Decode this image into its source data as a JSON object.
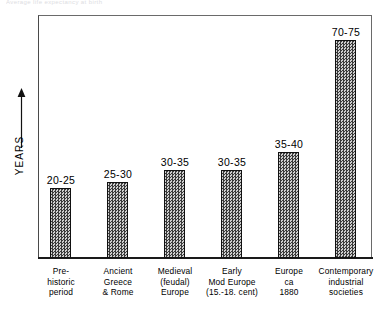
{
  "top_caption": "Average life expectancy at birth",
  "axis": {
    "y_title": "YEARS",
    "y_arrow_icon": "up-arrow-icon"
  },
  "chart_data": {
    "type": "bar",
    "title": "",
    "xlabel": "",
    "ylabel": "YEARS",
    "ylim": [
      0,
      80
    ],
    "grid": false,
    "legend": "none",
    "categories": [
      "Pre-historic period",
      "Ancient Greece & Rome",
      "Medieval (feudal) Europe",
      "Early Mod Europe (15.-18. cent)",
      "Europe ca 1880",
      "Contemporary industrial societies"
    ],
    "category_lines": [
      [
        "Pre-",
        "historic",
        "period"
      ],
      [
        "Ancient",
        "Greece",
        "& Rome"
      ],
      [
        "Medieval",
        "(feudal)",
        "Europe"
      ],
      [
        "Early",
        "Mod Europe",
        "(15.-18. cent)"
      ],
      [
        "Europe",
        "ca",
        "1880"
      ],
      [
        "Contemporary",
        "industrial",
        "societies"
      ]
    ],
    "value_labels": [
      "20-25",
      "25-30",
      "30-35",
      "30-35",
      "35-40",
      "70-75"
    ],
    "values": [
      22.5,
      27.5,
      32.5,
      32.5,
      37.5,
      72.5
    ],
    "value_low": [
      20,
      25,
      30,
      30,
      35,
      70
    ],
    "value_high": [
      25,
      30,
      35,
      35,
      40,
      75
    ],
    "bar_geometry": [
      {
        "left": 50,
        "top": 188,
        "height": 70
      },
      {
        "left": 107,
        "top": 182,
        "height": 76
      },
      {
        "left": 164,
        "top": 170,
        "height": 88
      },
      {
        "left": 221,
        "top": 170,
        "height": 88
      },
      {
        "left": 278,
        "top": 152,
        "height": 106
      },
      {
        "left": 335,
        "top": 40,
        "height": 218
      }
    ],
    "label_geometry": [
      {
        "left": 26,
        "top": 174
      },
      {
        "left": 83,
        "top": 168
      },
      {
        "left": 140,
        "top": 156
      },
      {
        "left": 197,
        "top": 156
      },
      {
        "left": 254,
        "top": 138
      },
      {
        "left": 311,
        "top": 26
      }
    ],
    "category_geometry": [
      {
        "left": 22
      },
      {
        "left": 79
      },
      {
        "left": 136
      },
      {
        "left": 193
      },
      {
        "left": 250
      },
      {
        "left": 307
      }
    ]
  },
  "colors": {
    "bar_fill_dark": "#3a3a3a",
    "bar_fill_light": "#cfcfcf",
    "bar_border": "#111111",
    "frame": "#4a4a4a",
    "background": "#ffffff",
    "text": "#000000"
  }
}
